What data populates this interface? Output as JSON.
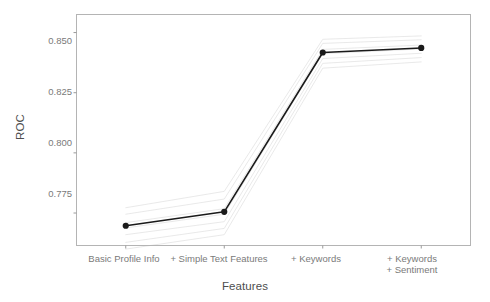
{
  "chart_data": {
    "type": "line",
    "title": "",
    "xlabel": "Features",
    "ylabel": "ROC",
    "categories": [
      "Basic Profile Info",
      "+ Simple Text Features",
      "+ Keywords",
      "+ Keywords\n+ Sentiment"
    ],
    "values": [
      0.7697,
      0.7755,
      0.8417,
      0.8436
    ],
    "series": [
      {
        "name": "mean",
        "values": [
          0.7697,
          0.7755,
          0.8417,
          0.8436
        ],
        "color": "#1a1a1a",
        "emphasis": "main",
        "markers": true
      },
      {
        "name": "fold-1",
        "values": [
          0.7772,
          0.784,
          0.8472,
          0.8486
        ],
        "color": "#e2e2e2",
        "emphasis": "faint",
        "markers": false
      },
      {
        "name": "fold-2",
        "values": [
          0.7745,
          0.7808,
          0.8455,
          0.847
        ],
        "color": "#e2e2e2",
        "emphasis": "faint",
        "markers": false
      },
      {
        "name": "fold-3",
        "values": [
          0.771,
          0.7768,
          0.843,
          0.8448
        ],
        "color": "#e2e2e2",
        "emphasis": "faint",
        "markers": false
      },
      {
        "name": "fold-4",
        "values": [
          0.7688,
          0.7745,
          0.8412,
          0.8432
        ],
        "color": "#e2e2e2",
        "emphasis": "faint",
        "markers": false
      },
      {
        "name": "fold-5",
        "values": [
          0.766,
          0.7714,
          0.8392,
          0.8414
        ],
        "color": "#e2e2e2",
        "emphasis": "faint",
        "markers": false
      },
      {
        "name": "fold-6",
        "values": [
          0.7628,
          0.7686,
          0.8372,
          0.8396
        ],
        "color": "#e2e2e2",
        "emphasis": "faint",
        "markers": false
      },
      {
        "name": "fold-7",
        "values": [
          0.76,
          0.766,
          0.8352,
          0.8378
        ],
        "color": "#e2e2e2",
        "emphasis": "faint",
        "markers": false
      }
    ],
    "yticks": [
      0.85,
      0.825,
      0.8,
      0.775
    ],
    "ytick_labels": [
      "0.850",
      "0.825",
      "0.800",
      "0.775"
    ],
    "xtick_labels": [
      "Basic Profile Info",
      "+ Simple Text Features",
      "+ Keywords",
      "+ Keywords"
    ],
    "xtick_label_second_line": [
      "",
      "",
      "",
      "+ Sentiment"
    ],
    "ylim": [
      0.7615,
      0.8575
    ],
    "xlim": [
      0.5,
      4.5
    ],
    "grid": false,
    "legend": "none",
    "panel_border_color": "#b4b4b4",
    "background": "#ffffff",
    "main_line_color": "#1a1a1a",
    "faint_line_color": "#e2e2e2",
    "axis_text_color": "#7a7a7a",
    "title_text_color": "#4d4d4d"
  }
}
